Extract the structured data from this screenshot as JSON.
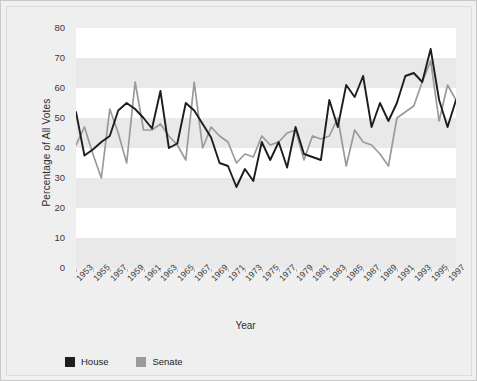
{
  "chart_data": {
    "type": "line",
    "title": "",
    "xlabel": "Year",
    "ylabel": "Percentage of All Votes",
    "ylim": [
      0,
      80
    ],
    "yticks": [
      0,
      10,
      20,
      30,
      40,
      50,
      60,
      70,
      80
    ],
    "xlim": [
      1953,
      1998
    ],
    "xticks": [
      1953,
      1955,
      1957,
      1959,
      1961,
      1963,
      1965,
      1967,
      1969,
      1971,
      1973,
      1975,
      1977,
      1979,
      1981,
      1983,
      1985,
      1987,
      1989,
      1991,
      1993,
      1995,
      1997
    ],
    "grid": "horizontal-bands",
    "legend_position": "bottom-left",
    "x": [
      1953,
      1954,
      1955,
      1956,
      1957,
      1958,
      1959,
      1960,
      1961,
      1962,
      1963,
      1964,
      1965,
      1966,
      1967,
      1968,
      1969,
      1970,
      1971,
      1972,
      1973,
      1974,
      1975,
      1976,
      1977,
      1978,
      1979,
      1980,
      1981,
      1982,
      1983,
      1984,
      1985,
      1986,
      1987,
      1988,
      1989,
      1990,
      1991,
      1992,
      1993,
      1994,
      1995,
      1996,
      1997,
      1998
    ],
    "series": [
      {
        "name": "House",
        "color": "#1d1d1d",
        "values": [
          52.0,
          37.5,
          39.5,
          42.0,
          44.0,
          52.5,
          55.0,
          53.0,
          50.0,
          46.5,
          59.0,
          40.0,
          41.5,
          55.0,
          52.5,
          48.0,
          43.5,
          35.0,
          34.0,
          27.0,
          33.0,
          29.0,
          42.0,
          36.0,
          42.0,
          33.5,
          47.0,
          38.0,
          37.0,
          36.0,
          56.0,
          47.0,
          61.0,
          57.0,
          64.0,
          47.0,
          55.0,
          49.0,
          55.0,
          64.0,
          65.0,
          62.0,
          73.0,
          56.0,
          47.0,
          56.0
        ]
      },
      {
        "name": "Senate",
        "color": "#9a9a9a",
        "values": [
          41.0,
          47.0,
          38.0,
          30.0,
          53.0,
          45.0,
          35.0,
          62.0,
          46.0,
          46.0,
          48.0,
          44.0,
          41.0,
          36.0,
          62.0,
          40.0,
          47.0,
          44.0,
          42.0,
          35.0,
          38.0,
          37.0,
          44.0,
          41.0,
          42.0,
          45.0,
          46.0,
          36.0,
          44.0,
          43.0,
          44.0,
          50.0,
          34.0,
          46.0,
          42.0,
          41.0,
          38.0,
          34.0,
          50.0,
          52.0,
          54.0,
          62.0,
          69.0,
          49.0,
          61.0,
          56.0
        ]
      }
    ]
  },
  "legend": {
    "items": [
      {
        "label": "House",
        "color": "#1d1d1d"
      },
      {
        "label": "Senate",
        "color": "#9a9a9a"
      }
    ]
  }
}
